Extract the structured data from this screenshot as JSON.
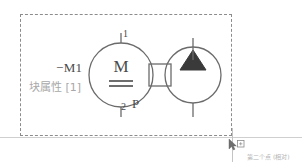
{
  "diagram": {
    "type": "electro-hydraulic schematic symbol",
    "selection": {
      "name": "selection-bounding-box",
      "style": "dashed"
    },
    "block": {
      "designation": "−M1",
      "attribute_label": "块属性 [1]"
    },
    "motor": {
      "symbol_letter": "M",
      "symbol_kind": "dc-motor",
      "terminal_top": "1",
      "terminal_bottom": "2",
      "port_label": "P"
    },
    "pump": {
      "symbol_kind": "hydraulic-pump",
      "fill_color": "#3a3a3a"
    },
    "coupling": {
      "symbol_kind": "shaft-coupling"
    },
    "colors": {
      "stroke": "#6b6b6b",
      "dashed_border": "#8c8c8c",
      "text_dark": "#4a4a4a",
      "text_light": "#a8a8a8",
      "baseline": "#cfcfcf",
      "fill_dark": "#3a3a3a"
    }
  },
  "cursor": {
    "icon": "arrow-pointer-with-box",
    "tooltip": "第二个点 (相对)"
  }
}
